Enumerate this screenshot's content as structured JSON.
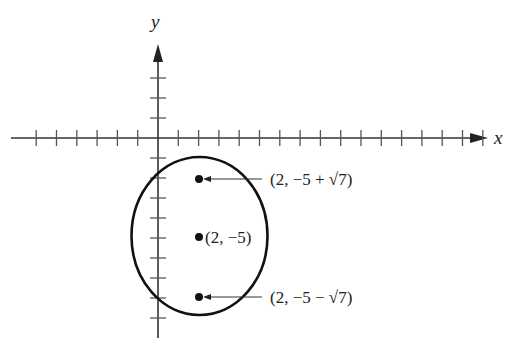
{
  "diagram": {
    "type": "coordinate-plane-ellipse",
    "axes": {
      "x_label": "x",
      "y_label": "y",
      "x_ticks_left": 6,
      "x_ticks_right": 16,
      "y_ticks_above": 3,
      "y_ticks_below": 9
    },
    "ellipse": {
      "center": [
        2,
        -5
      ],
      "description": "vertical ellipse centered at (2, -5)"
    },
    "points": [
      {
        "label": "(2, −5 + √7)",
        "coords": "(2, -5+sqrt7)",
        "role": "focus-upper"
      },
      {
        "label": "(2, −5)",
        "coords": "(2, -5)",
        "role": "center"
      },
      {
        "label": "(2, −5 − √7)",
        "coords": "(2, -5-sqrt7)",
        "role": "focus-lower"
      }
    ],
    "colors": {
      "ink": "#222222",
      "background": "#ffffff"
    }
  }
}
